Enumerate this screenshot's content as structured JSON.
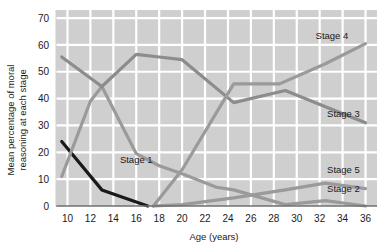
{
  "chart_data": {
    "type": "line",
    "title": "",
    "xlabel": "Age (years)",
    "ylabel": "Mean percentage of moral reasoning at each stage",
    "xlim": [
      9,
      37
    ],
    "ylim": [
      0,
      73
    ],
    "xticks": [
      10,
      12,
      14,
      16,
      18,
      20,
      22,
      24,
      26,
      28,
      30,
      32,
      34,
      36
    ],
    "yticks": [
      0,
      10,
      20,
      30,
      40,
      50,
      60,
      70
    ],
    "grid": true,
    "legend_position": "inline-right",
    "plot_background": "#cfcfcf",
    "gridline_color": "#ffffff",
    "series": [
      {
        "name": "Stage 1",
        "color": "#1a1a1a",
        "label_x": 16.0,
        "label_y": 17.5,
        "label_anchor": "middle",
        "x": [
          9.5,
          13,
          17
        ],
        "y": [
          24,
          6,
          0
        ]
      },
      {
        "name": "Stage 2",
        "color": "#9a9a9a",
        "label_x": 35.5,
        "label_y": 6.5,
        "label_anchor": "end",
        "x": [
          9.5,
          12,
          13,
          16,
          18,
          20,
          23,
          24.5,
          29,
          32.5,
          36
        ],
        "y": [
          11,
          39,
          44.5,
          19.5,
          15,
          12,
          7,
          6,
          0.5,
          2,
          0
        ]
      },
      {
        "name": "Stage 3",
        "color": "#8c8c8c",
        "label_x": 35.5,
        "label_y": 34.5,
        "label_anchor": "end",
        "x": [
          9.5,
          13,
          16,
          18,
          20,
          24.5,
          29,
          32.5,
          36
        ],
        "y": [
          55.5,
          44.5,
          56.5,
          55.5,
          54.5,
          38.5,
          43,
          37,
          31
        ]
      },
      {
        "name": "Stage 4",
        "color": "#9a9a9a",
        "label_x": 34.5,
        "label_y": 63.5,
        "label_anchor": "end",
        "x": [
          17.5,
          20,
          24.5,
          28.5,
          32.5,
          36
        ],
        "y": [
          0,
          13.5,
          45.5,
          45.5,
          53,
          60.5
        ]
      },
      {
        "name": "Stage 5",
        "color": "#9a9a9a",
        "label_x": 35.5,
        "label_y": 13.5,
        "label_anchor": "end",
        "x": [
          17.5,
          20,
          24.5,
          29,
          32.5,
          36
        ],
        "y": [
          0,
          0.5,
          3,
          6,
          8.5,
          6.5
        ]
      }
    ]
  },
  "axes": {
    "ylabel_line1": "Mean percentage of moral",
    "ylabel_line2": "reasoning at each stage",
    "xlabel": "Age (years)"
  }
}
